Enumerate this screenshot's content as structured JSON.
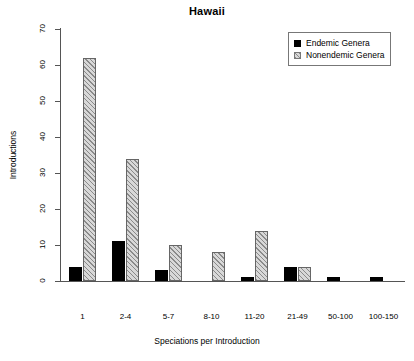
{
  "chart_data": {
    "type": "bar",
    "title": "Hawaii",
    "xlabel": "Speciations per Introduction",
    "ylabel": "Introductions",
    "categories": [
      "1",
      "2-4",
      "5-7",
      "8-10",
      "11-20",
      "21-49",
      "50-100",
      "100-150"
    ],
    "series": [
      {
        "name": "Endemic Genera",
        "values": [
          4,
          11,
          3,
          0,
          1,
          4,
          1,
          1
        ]
      },
      {
        "name": "Nonendemic Genera",
        "values": [
          62,
          34,
          10,
          8,
          14,
          4,
          0,
          0
        ]
      }
    ],
    "ylim": [
      0,
      70
    ],
    "yticks": [
      0,
      10,
      20,
      30,
      40,
      50,
      60,
      70
    ],
    "grid": false,
    "legend_position": "top-right",
    "colors": {
      "endemic": "#000000",
      "nonendemic_fill": "#d8d8d8",
      "nonendemic_hatch": "#8a8a8a",
      "axis": "#555555"
    }
  },
  "legend": {
    "entries": [
      {
        "label": "Endemic Genera",
        "swatch": "solid-black-square"
      },
      {
        "label": "Nonendemic Genera",
        "swatch": "hatched-gray-square"
      }
    ]
  }
}
